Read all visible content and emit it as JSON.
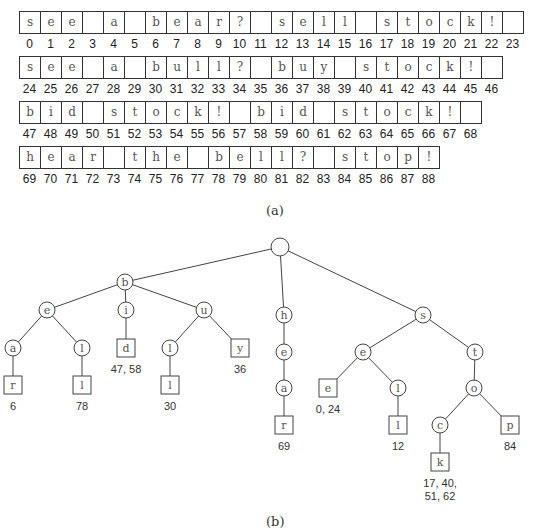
{
  "array_rows": [
    {
      "start": 0,
      "cells": [
        "s",
        "e",
        "e",
        "",
        "a",
        "",
        "b",
        "e",
        "a",
        "r",
        "?",
        "",
        "s",
        "e",
        "l",
        "l",
        "",
        "s",
        "t",
        "o",
        "c",
        "k",
        "!",
        ""
      ]
    },
    {
      "start": 24,
      "cells": [
        "s",
        "e",
        "e",
        "",
        "a",
        "",
        "b",
        "u",
        "l",
        "l",
        "?",
        "",
        "b",
        "u",
        "y",
        "",
        "s",
        "t",
        "o",
        "c",
        "k",
        "!",
        ""
      ]
    },
    {
      "start": 47,
      "cells": [
        "b",
        "i",
        "d",
        "",
        "s",
        "t",
        "o",
        "c",
        "k",
        "!",
        "",
        "b",
        "i",
        "d",
        "",
        "s",
        "t",
        "o",
        "c",
        "k",
        "!",
        ""
      ]
    },
    {
      "start": 69,
      "cells": [
        "h",
        "e",
        "a",
        "r",
        "",
        "t",
        "h",
        "e",
        "",
        "b",
        "e",
        "l",
        "l",
        "?",
        "",
        "s",
        "t",
        "o",
        "p",
        "!"
      ]
    }
  ],
  "caption_a": "(a)",
  "caption_b": "(b)",
  "tree": {
    "nodes": [
      {
        "id": "root",
        "label": "",
        "shape": "circle",
        "x": 280,
        "y": 17
      },
      {
        "id": "b",
        "label": "b",
        "shape": "circle",
        "x": 125,
        "y": 52
      },
      {
        "id": "h",
        "label": "h",
        "shape": "circle",
        "x": 284,
        "y": 85
      },
      {
        "id": "s",
        "label": "s",
        "shape": "circle",
        "x": 423,
        "y": 85
      },
      {
        "id": "be",
        "label": "e",
        "shape": "circle",
        "x": 47,
        "y": 80
      },
      {
        "id": "bi",
        "label": "i",
        "shape": "circle",
        "x": 126,
        "y": 80
      },
      {
        "id": "bu",
        "label": "u",
        "shape": "circle",
        "x": 204,
        "y": 80
      },
      {
        "id": "bea",
        "label": "a",
        "shape": "circle",
        "x": 13,
        "y": 118
      },
      {
        "id": "bel",
        "label": "l",
        "shape": "circle",
        "x": 82,
        "y": 118
      },
      {
        "id": "bid",
        "label": "d",
        "shape": "square",
        "x": 126,
        "y": 118
      },
      {
        "id": "bul",
        "label": "l",
        "shape": "circle",
        "x": 170,
        "y": 118
      },
      {
        "id": "buy",
        "label": "y",
        "shape": "square",
        "x": 240,
        "y": 118
      },
      {
        "id": "bear",
        "label": "r",
        "shape": "square",
        "x": 13,
        "y": 155
      },
      {
        "id": "bell",
        "label": "l",
        "shape": "square",
        "x": 82,
        "y": 155
      },
      {
        "id": "bull",
        "label": "l",
        "shape": "square",
        "x": 170,
        "y": 155
      },
      {
        "id": "he",
        "label": "e",
        "shape": "circle",
        "x": 284,
        "y": 122
      },
      {
        "id": "hea",
        "label": "a",
        "shape": "circle",
        "x": 284,
        "y": 158
      },
      {
        "id": "hear",
        "label": "r",
        "shape": "square",
        "x": 284,
        "y": 195
      },
      {
        "id": "se",
        "label": "e",
        "shape": "circle",
        "x": 363,
        "y": 122
      },
      {
        "id": "st",
        "label": "t",
        "shape": "circle",
        "x": 475,
        "y": 122
      },
      {
        "id": "see",
        "label": "e",
        "shape": "square",
        "x": 328,
        "y": 158
      },
      {
        "id": "sel",
        "label": "l",
        "shape": "circle",
        "x": 398,
        "y": 158
      },
      {
        "id": "sell",
        "label": "l",
        "shape": "square",
        "x": 398,
        "y": 195
      },
      {
        "id": "sto",
        "label": "o",
        "shape": "circle",
        "x": 474,
        "y": 158
      },
      {
        "id": "stoc",
        "label": "c",
        "shape": "circle",
        "x": 440,
        "y": 195
      },
      {
        "id": "stop",
        "label": "p",
        "shape": "square",
        "x": 510,
        "y": 195
      },
      {
        "id": "stock",
        "label": "k",
        "shape": "square",
        "x": 440,
        "y": 232
      }
    ],
    "edges": [
      [
        "root",
        "b"
      ],
      [
        "root",
        "h"
      ],
      [
        "root",
        "s"
      ],
      [
        "b",
        "be"
      ],
      [
        "b",
        "bi"
      ],
      [
        "b",
        "bu"
      ],
      [
        "be",
        "bea"
      ],
      [
        "be",
        "bel"
      ],
      [
        "bi",
        "bid"
      ],
      [
        "bu",
        "bul"
      ],
      [
        "bu",
        "buy"
      ],
      [
        "bea",
        "bear"
      ],
      [
        "bel",
        "bell"
      ],
      [
        "bul",
        "bull"
      ],
      [
        "h",
        "he"
      ],
      [
        "he",
        "hea"
      ],
      [
        "hea",
        "hear"
      ],
      [
        "s",
        "se"
      ],
      [
        "s",
        "st"
      ],
      [
        "se",
        "see"
      ],
      [
        "se",
        "sel"
      ],
      [
        "sel",
        "sell"
      ],
      [
        "st",
        "sto"
      ],
      [
        "sto",
        "stoc"
      ],
      [
        "sto",
        "stop"
      ],
      [
        "stoc",
        "stock"
      ]
    ],
    "occurrences": [
      {
        "node": "bear",
        "text": [
          "6"
        ]
      },
      {
        "node": "bell",
        "text": [
          "78"
        ]
      },
      {
        "node": "bid",
        "text": [
          "47, 58"
        ]
      },
      {
        "node": "bull",
        "text": [
          "30"
        ]
      },
      {
        "node": "buy",
        "text": [
          "36"
        ]
      },
      {
        "node": "hear",
        "text": [
          "69"
        ]
      },
      {
        "node": "see",
        "text": [
          "0, 24"
        ]
      },
      {
        "node": "sell",
        "text": [
          "12"
        ]
      },
      {
        "node": "stop",
        "text": [
          "84"
        ]
      },
      {
        "node": "stock",
        "text": [
          "17, 40,",
          "51, 62"
        ]
      }
    ]
  }
}
